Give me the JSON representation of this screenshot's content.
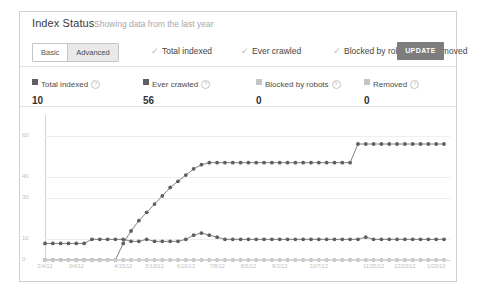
{
  "header": {
    "title": "Index Status",
    "subtitle": "Showing data from the last year"
  },
  "toolbar": {
    "segmented": [
      {
        "label": "Basic",
        "selected": false
      },
      {
        "label": "Advanced",
        "selected": true
      }
    ],
    "checkboxes": [
      {
        "label": "Total indexed",
        "checked": true,
        "tick": "✓"
      },
      {
        "label": "Ever crawled",
        "checked": true,
        "tick": "✓"
      },
      {
        "label": "Blocked by robots",
        "checked": true,
        "tick": "✓"
      },
      {
        "label": "Removed",
        "checked": true,
        "tick": "✓"
      }
    ],
    "update_label": "UPDATE"
  },
  "stats": [
    {
      "name": "Total indexed",
      "value": "10",
      "color": "#5f5f5f",
      "help": "?"
    },
    {
      "name": "Ever crawled",
      "value": "56",
      "color": "#5f5f5f",
      "help": "?"
    },
    {
      "name": "Blocked by robots",
      "value": "0",
      "color": "#c5c5c5",
      "help": "?"
    },
    {
      "name": "Removed",
      "value": "0",
      "color": "#c5c5c5",
      "help": "?"
    }
  ],
  "chart_data": {
    "type": "line",
    "title": "Index Status",
    "xlabel": "",
    "ylabel": "",
    "ylim": [
      0,
      70
    ],
    "yticks": [
      60,
      40,
      30,
      10,
      0
    ],
    "grid": true,
    "legend_position": "top",
    "x": [
      "2/4/12",
      "2/11/12",
      "2/18/12",
      "2/25/12",
      "3/4/12",
      "3/11/12",
      "3/18/12",
      "3/25/12",
      "4/1/12",
      "4/8/12",
      "4/15/12",
      "4/22/12",
      "4/29/12",
      "5/6/12",
      "5/13/12",
      "5/20/12",
      "5/27/12",
      "6/3/12",
      "6/10/12",
      "6/17/12",
      "6/24/12",
      "7/1/12",
      "7/8/12",
      "7/15/12",
      "7/22/12",
      "7/29/12",
      "8/5/12",
      "8/12/12",
      "8/19/12",
      "8/26/12",
      "9/2/12",
      "9/9/12",
      "9/16/12",
      "9/23/12",
      "9/30/12",
      "10/7/12",
      "10/14/12",
      "10/21/12",
      "10/28/12",
      "11/4/12",
      "11/11/12",
      "11/18/12",
      "11/25/12",
      "12/2/12",
      "12/9/12",
      "12/16/12",
      "12/23/12",
      "12/30/12",
      "1/6/13",
      "1/13/13",
      "1/20/13",
      "1/27/13"
    ],
    "xtick_labels": [
      "2/4/12",
      "3/4/12",
      "4/15/12",
      "5/13/12",
      "6/10/12",
      "7/8/12",
      "8/5/12",
      "9/2/12",
      "10/7/12",
      "11/25/12",
      "12/23/12",
      "1/20/13"
    ],
    "series": [
      {
        "name": "Total indexed",
        "color": "#5f5f5f",
        "values": [
          8,
          8,
          8,
          8,
          8,
          8,
          10,
          10,
          10,
          10,
          10,
          9,
          9,
          10,
          9,
          9,
          9,
          9,
          10,
          12,
          13,
          12,
          11,
          10,
          10,
          10,
          10,
          10,
          10,
          10,
          10,
          10,
          10,
          10,
          10,
          10,
          10,
          10,
          10,
          10,
          10,
          11,
          10,
          10,
          10,
          10,
          10,
          10,
          10,
          10,
          10,
          10
        ]
      },
      {
        "name": "Ever crawled",
        "color": "#5f5f5f",
        "values": [
          0,
          0,
          0,
          0,
          0,
          0,
          0,
          0,
          0,
          0,
          8,
          14,
          19,
          23,
          27,
          31,
          35,
          38,
          41,
          44,
          46,
          47,
          47,
          47,
          47,
          47,
          47,
          47,
          47,
          47,
          47,
          47,
          47,
          47,
          47,
          47,
          47,
          47,
          47,
          47,
          56,
          56,
          56,
          56,
          56,
          56,
          56,
          56,
          56,
          56,
          56,
          56
        ]
      },
      {
        "name": "Blocked by robots",
        "color": "#c5c5c5",
        "values": [
          0,
          0,
          0,
          0,
          0,
          0,
          0,
          0,
          0,
          0,
          0,
          0,
          0,
          0,
          0,
          0,
          0,
          0,
          0,
          0,
          0,
          0,
          0,
          0,
          0,
          0,
          0,
          0,
          0,
          0,
          0,
          0,
          0,
          0,
          0,
          0,
          0,
          0,
          0,
          0,
          0,
          0,
          0,
          0,
          0,
          0,
          0,
          0,
          0,
          0,
          0,
          0
        ]
      },
      {
        "name": "Removed",
        "color": "#c5c5c5",
        "values": [
          0,
          0,
          0,
          0,
          0,
          0,
          0,
          0,
          0,
          0,
          0,
          0,
          0,
          0,
          0,
          0,
          0,
          0,
          0,
          0,
          0,
          0,
          0,
          0,
          0,
          0,
          0,
          0,
          0,
          0,
          0,
          0,
          0,
          0,
          0,
          0,
          0,
          0,
          0,
          0,
          0,
          0,
          0,
          0,
          0,
          0,
          0,
          0,
          0,
          0,
          0,
          0
        ]
      }
    ]
  }
}
